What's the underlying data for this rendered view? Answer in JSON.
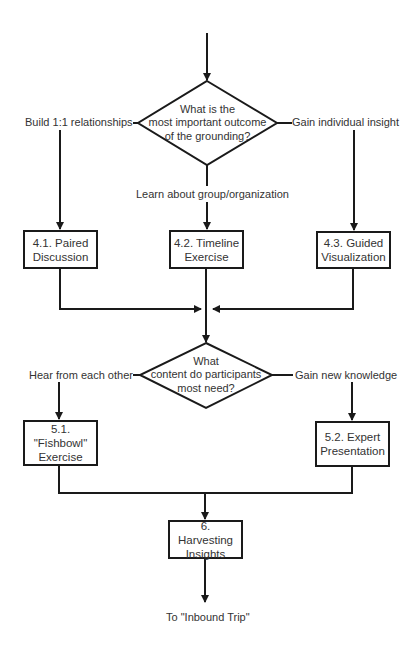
{
  "diagram": {
    "type": "flowchart",
    "colors": {
      "line": "#1a1a1a",
      "text": "#333333",
      "background": "#ffffff"
    },
    "decisions": [
      {
        "id": "d1",
        "lines": [
          "What is the",
          "most important outcome",
          "of the grounding?"
        ]
      },
      {
        "id": "d2",
        "lines": [
          "What",
          "content do participants",
          "most need?"
        ]
      }
    ],
    "nodes": [
      {
        "id": "n41",
        "lines": [
          "4.1. Paired",
          "Discussion"
        ]
      },
      {
        "id": "n42",
        "lines": [
          "4.2. Timeline",
          "Exercise"
        ]
      },
      {
        "id": "n43",
        "lines": [
          "4.3. Guided",
          "Visualization"
        ]
      },
      {
        "id": "n51",
        "lines": [
          "5.1. \"Fishbowl\"",
          "Exercise"
        ]
      },
      {
        "id": "n52",
        "lines": [
          "5.2. Expert",
          "Presentation"
        ]
      },
      {
        "id": "n6",
        "lines": [
          "6. Harvesting",
          "Insights"
        ]
      }
    ],
    "edge_labels": {
      "d1_left": "Build 1:1 relationships",
      "d1_right": "Gain individual insight",
      "d1_bottom": "Learn about group/organization",
      "d2_left": "Hear from each other",
      "d2_right": "Gain new knowledge"
    },
    "terminal": {
      "label": "To \"Inbound Trip\""
    }
  }
}
